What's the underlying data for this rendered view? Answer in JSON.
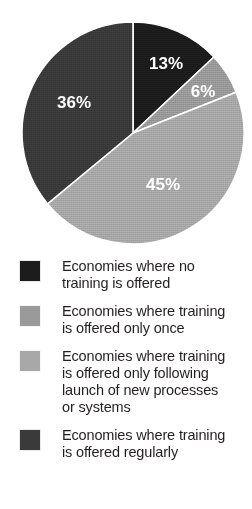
{
  "chart_data": {
    "type": "pie",
    "title": "",
    "categories": [
      "Economies where no training is offered",
      "Economies where training is offered only once",
      "Economies where training is offered only following launch of new processes or systems",
      "Economies where training is offered regularly"
    ],
    "values": [
      13,
      6,
      45,
      36
    ],
    "labels": [
      "13%",
      "6%",
      "45%",
      "36%"
    ],
    "colors": [
      "#1c1c1c",
      "#9a9a9a",
      "#a8a8a8",
      "#3a3a3a"
    ],
    "units": "percent",
    "start_angle_deg": 0,
    "direction": "clockwise",
    "legend_position": "bottom",
    "grid": false,
    "separator_color": "#ffffff"
  },
  "pie": {
    "slices": [
      {
        "label": "13%",
        "value": 13,
        "color": "#1c1c1c",
        "label_x": 166,
        "label_y": 65
      },
      {
        "label": "6%",
        "value": 6,
        "color": "#9a9a9a",
        "label_x": 203,
        "label_y": 93
      },
      {
        "label": "45%",
        "value": 45,
        "color": "#a8a8a8",
        "label_x": 163,
        "label_y": 186
      },
      {
        "label": "36%",
        "value": 36,
        "color": "#3a3a3a",
        "label_x": 74,
        "label_y": 104
      }
    ]
  },
  "legend": {
    "items": [
      {
        "swatch_color": "#1c1c1c",
        "label": "Economies where no\ntraining is offered"
      },
      {
        "swatch_color": "#9a9a9a",
        "label": "Economies where training\nis offered only once"
      },
      {
        "swatch_color": "#a8a8a8",
        "label": "Economies where training\nis offered only following\nlaunch of new processes\nor systems"
      },
      {
        "swatch_color": "#3a3a3a",
        "label": "Economies where training\nis offered regularly"
      }
    ]
  }
}
